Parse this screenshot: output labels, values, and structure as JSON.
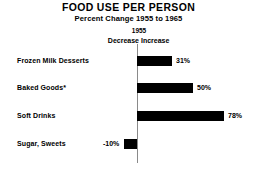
{
  "chart_data": {
    "type": "bar",
    "orientation": "horizontal",
    "title": "FOOD USE PER PERSON",
    "subtitle": "Percent Change 1955 to 1965",
    "baseline_label": "1955",
    "direction_labels": {
      "negative": "Decrease",
      "positive": "Increase"
    },
    "categories": [
      "Frozen Milk Desserts",
      "Baked Goods*",
      "Soft Drinks",
      "Sugar, Sweets"
    ],
    "values": [
      31,
      50,
      78,
      -10
    ],
    "value_labels": [
      "31%",
      "50%",
      "78%",
      "-10%"
    ],
    "xlabel": "",
    "ylabel": "",
    "xlim": [
      -20,
      90
    ],
    "grid": false,
    "legend": "none",
    "bar_color": "#000000",
    "axis_color": "#8a8a8a",
    "background": "#ffffff"
  },
  "geometry": {
    "zero_x": 137,
    "px_per_percent": 1.115,
    "row_tops": [
      52,
      79,
      107,
      135
    ],
    "rows": [
      {
        "bar_left": 137,
        "bar_width": 35,
        "label_left": 176,
        "negative": false
      },
      {
        "bar_left": 137,
        "bar_width": 56,
        "label_left": 197,
        "negative": false
      },
      {
        "bar_left": 137,
        "bar_width": 87,
        "label_left": 228,
        "negative": false
      },
      {
        "bar_left": 124,
        "bar_width": 13,
        "label_left": 103,
        "negative": true
      }
    ]
  }
}
